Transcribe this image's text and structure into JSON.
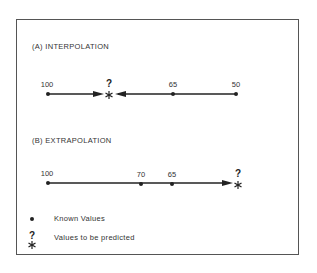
{
  "panel_a": {
    "title": "(A) INTERPOLATION",
    "known_values": [
      "100",
      "65",
      "50"
    ],
    "predicted_marker": "?"
  },
  "panel_b": {
    "title": "(B) EXTRAPOLATION",
    "known_values": [
      "100",
      "70",
      "65"
    ],
    "predicted_marker": "?"
  },
  "legend": {
    "known_label": "Known Values",
    "predicted_label": "Values to be predicted",
    "predicted_marker": "?"
  },
  "colors": {
    "ink": "#222222",
    "frame": "#555555",
    "background": "#ffffff"
  }
}
